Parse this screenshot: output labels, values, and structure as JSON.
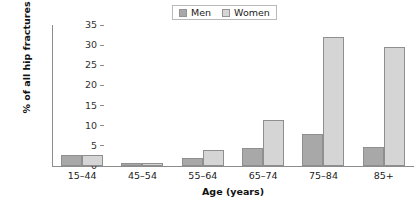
{
  "chart_data": {
    "type": "bar",
    "title": "",
    "subtitle": "",
    "xlabel": "Age (years)",
    "ylabel": "% of all hip fractures",
    "categories": [
      "15–44",
      "45–54",
      "55–64",
      "65–74",
      "75–84",
      "85+"
    ],
    "series": [
      {
        "name": "Men",
        "color": "#a8a8a8",
        "values": [
          2.8,
          0.7,
          2.0,
          4.5,
          8.0,
          4.8
        ]
      },
      {
        "name": "Women",
        "color": "#d5d5d5",
        "values": [
          2.8,
          0.7,
          4.0,
          11.5,
          32.0,
          29.5
        ]
      }
    ],
    "ylim": [
      0,
      35
    ],
    "ytick_values": [
      0,
      5,
      10,
      15,
      20,
      25,
      30,
      35
    ],
    "ytick_labels": [
      "0",
      "5",
      "10",
      "15",
      "20",
      "25",
      "30",
      "35"
    ],
    "grid": false,
    "legend_position": "top-center",
    "bar_outline_color": "#8f8f8f",
    "axis_color": "#8c8c8c"
  },
  "legend": {
    "entries": [
      {
        "label": "Men"
      },
      {
        "label": "Women"
      }
    ]
  }
}
